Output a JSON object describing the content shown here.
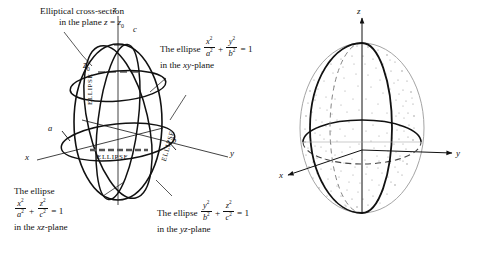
{
  "figure": {
    "background_color": "#ffffff",
    "stroke_color": "#111111",
    "stipple_color": "#8a8a8a"
  },
  "left_panel": {
    "name": "ellipsoid-with-cross-sections",
    "axes": [
      {
        "id": "z",
        "label": "z"
      },
      {
        "id": "x",
        "label": "x"
      },
      {
        "id": "y",
        "label": "y"
      }
    ],
    "intercepts": [
      {
        "id": "c",
        "label": "c"
      },
      {
        "id": "a",
        "label": "a"
      },
      {
        "id": "b",
        "label": "b"
      }
    ],
    "plane_label": "z",
    "plane_sub": "0",
    "curve_words": [
      "ELLIPSE",
      "ELLIPSE",
      "ELLIPSE"
    ],
    "callouts": {
      "cross_section": {
        "line1": "Elliptical cross-section",
        "line2_prefix": "in the plane ",
        "line2_var": "z",
        "line2_eq": " = ",
        "line2_val": "z",
        "line2_val_sub": "0"
      },
      "xy_ellipse": {
        "lead": "The ellipse",
        "num1": "x",
        "num1_exp": "2",
        "den1": "a",
        "den1_exp": "2",
        "op": "+",
        "num2": "y",
        "num2_exp": "2",
        "den2": "b",
        "den2_exp": "2",
        "equals": "= 1",
        "tail_prefix": "in the ",
        "tail_plane": "xy",
        "tail_suffix": "-plane"
      },
      "xz_ellipse": {
        "lead": "The ellipse",
        "num1": "x",
        "num1_exp": "2",
        "den1": "a",
        "den1_exp": "2",
        "op": "+",
        "num2": "z",
        "num2_exp": "2",
        "den2": "c",
        "den2_exp": "2",
        "equals": "= 1",
        "tail_prefix": "in the ",
        "tail_plane": "xz",
        "tail_suffix": "-plane"
      },
      "yz_ellipse": {
        "lead": "The ellipse",
        "num1": "y",
        "num1_exp": "2",
        "den1": "b",
        "den1_exp": "2",
        "op": "+",
        "num2": "z",
        "num2_exp": "2",
        "den2": "c",
        "den2_exp": "2",
        "equals": "= 1",
        "tail_prefix": "in the ",
        "tail_plane": "yz",
        "tail_suffix": "-plane"
      }
    }
  },
  "right_panel": {
    "name": "shaded-ellipsoid",
    "axes": [
      {
        "id": "z",
        "label": "z"
      },
      {
        "id": "x",
        "label": "x"
      },
      {
        "id": "y",
        "label": "y"
      }
    ]
  }
}
